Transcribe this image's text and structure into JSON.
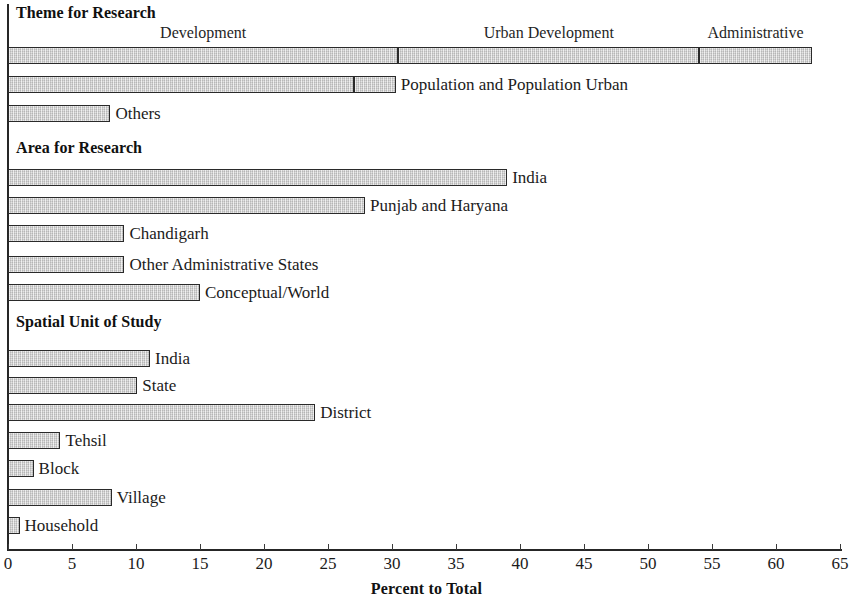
{
  "chart_data": {
    "type": "bar",
    "orientation": "horizontal",
    "title": "",
    "xlabel": "Percent to Total",
    "ylabel": "",
    "xlim": [
      0,
      65
    ],
    "xticks": [
      0,
      5,
      10,
      15,
      20,
      25,
      30,
      35,
      40,
      45,
      50,
      55,
      60,
      65
    ],
    "xtick_labels": [
      "0",
      "5",
      "10",
      "15",
      "20",
      "25",
      "30",
      "35",
      "40",
      "45",
      "50",
      "55",
      "60",
      "65"
    ],
    "grid": false,
    "legend": "none",
    "bar_fill_color": "#d4d4d4",
    "bar_edge_color": "#2a2a2a",
    "axis_color": "#262626",
    "groups": [
      {
        "heading": "Theme for Research",
        "bars": [
          {
            "label": "",
            "stacked": true,
            "segments": [
              {
                "name": "Development",
                "value": 30.5
              },
              {
                "name": "Urban Development",
                "value": 23.5
              },
              {
                "name": "Administrative",
                "value": 8.8
              }
            ],
            "total": 62.8
          },
          {
            "label": "Population and Population Urban",
            "stacked": true,
            "segments": [
              {
                "name": "Population",
                "value": 27.0
              },
              {
                "name": "Population Urban",
                "value": 3.3
              }
            ],
            "total": 30.3
          },
          {
            "label": "Others",
            "stacked": false,
            "value": 8.0
          }
        ]
      },
      {
        "heading": "Area for Research",
        "bars": [
          {
            "label": "India",
            "stacked": false,
            "value": 39.0
          },
          {
            "label": "Punjab and Haryana",
            "stacked": false,
            "value": 27.9
          },
          {
            "label": "Chandigarh",
            "stacked": false,
            "value": 9.1
          },
          {
            "label": "Other Administrative States",
            "stacked": false,
            "value": 9.1
          },
          {
            "label": "Conceptual/World",
            "stacked": false,
            "value": 15.0
          }
        ]
      },
      {
        "heading": "Spatial Unit of Study",
        "bars": [
          {
            "label": "India",
            "stacked": false,
            "value": 11.1
          },
          {
            "label": "State",
            "stacked": false,
            "value": 10.1
          },
          {
            "label": "District",
            "stacked": false,
            "value": 24.0
          },
          {
            "label": "Tehsil",
            "stacked": false,
            "value": 4.1
          },
          {
            "label": "Block",
            "stacked": false,
            "value": 2.0
          },
          {
            "label": "Village",
            "stacked": false,
            "value": 8.1
          },
          {
            "label": "Household",
            "stacked": false,
            "value": 0.9
          }
        ]
      }
    ]
  },
  "layout": {
    "x0_px": 8,
    "px_per_unit": 12.8,
    "bar_height_px": 17,
    "heading_offset_px": 5,
    "group_tops": [
      4,
      139,
      313
    ],
    "heading_tops": [
      4,
      139,
      313
    ],
    "rows": [
      {
        "group": 0,
        "bar": 0,
        "top": 47
      },
      {
        "group": 0,
        "bar": 1,
        "top": 76
      },
      {
        "group": 0,
        "bar": 2,
        "top": 105
      },
      {
        "group": 1,
        "bar": 0,
        "top": 169
      },
      {
        "group": 1,
        "bar": 1,
        "top": 197
      },
      {
        "group": 1,
        "bar": 2,
        "top": 225
      },
      {
        "group": 1,
        "bar": 3,
        "top": 256
      },
      {
        "group": 1,
        "bar": 4,
        "top": 284
      },
      {
        "group": 2,
        "bar": 0,
        "top": 350
      },
      {
        "group": 2,
        "bar": 1,
        "top": 377
      },
      {
        "group": 2,
        "bar": 2,
        "top": 404
      },
      {
        "group": 2,
        "bar": 3,
        "top": 432
      },
      {
        "group": 2,
        "bar": 4,
        "top": 460
      },
      {
        "group": 2,
        "bar": 5,
        "top": 489
      },
      {
        "group": 2,
        "bar": 6,
        "top": 517
      }
    ],
    "segment_labels_top": 24
  }
}
